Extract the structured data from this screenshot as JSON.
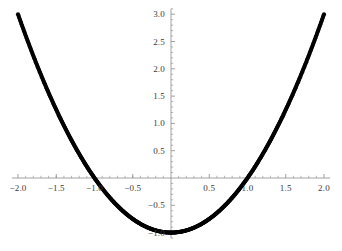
{
  "chart_data": {
    "type": "scatter",
    "title": "",
    "subtitle": "",
    "xlabel": "",
    "ylabel": "",
    "xlim": [
      -2.08,
      2.08
    ],
    "ylim": [
      -1.1,
      3.1
    ],
    "grid": false,
    "legend": null,
    "axes_style": "crossing-at-origin",
    "marker": "filled-circle",
    "marker_color": "#000000",
    "axis_color": "#808080",
    "function": "y = x^2 - 1",
    "x_ticks": [
      {
        "value": -2.0,
        "label": "-2.0"
      },
      {
        "value": -1.5,
        "label": "-1.5"
      },
      {
        "value": -1.0,
        "label": "-1.0"
      },
      {
        "value": -0.5,
        "label": "-0.5"
      },
      {
        "value": 0.5,
        "label": "0.5"
      },
      {
        "value": 1.0,
        "label": "1.0"
      },
      {
        "value": 1.5,
        "label": "1.5"
      },
      {
        "value": 2.0,
        "label": "2.0"
      }
    ],
    "y_ticks": [
      {
        "value": 3.0,
        "label": "3.0"
      },
      {
        "value": 2.5,
        "label": "2.5"
      },
      {
        "value": 2.0,
        "label": "2.0"
      },
      {
        "value": 1.5,
        "label": "1.5"
      },
      {
        "value": 1.0,
        "label": "1.0"
      },
      {
        "value": 0.5,
        "label": "0.5"
      },
      {
        "value": -0.5,
        "label": "-0.5"
      },
      {
        "value": -1.0,
        "label": "-1.0"
      }
    ],
    "x_minor_tick_step": 0.1,
    "y_minor_tick_step": 0.1,
    "series": [
      {
        "name": "y = x^2 - 1",
        "points": [
          [
            -2.0,
            3.0
          ],
          [
            -1.96,
            2.842
          ],
          [
            -1.92,
            2.686
          ],
          [
            -1.88,
            2.534
          ],
          [
            -1.84,
            2.386
          ],
          [
            -1.8,
            2.24
          ],
          [
            -1.76,
            2.098
          ],
          [
            -1.72,
            1.958
          ],
          [
            -1.68,
            1.822
          ],
          [
            -1.64,
            1.69
          ],
          [
            -1.6,
            1.56
          ],
          [
            -1.56,
            1.434
          ],
          [
            -1.52,
            1.31
          ],
          [
            -1.48,
            1.19
          ],
          [
            -1.44,
            1.074
          ],
          [
            -1.4,
            0.96
          ],
          [
            -1.36,
            0.85
          ],
          [
            -1.32,
            0.742
          ],
          [
            -1.28,
            0.638
          ],
          [
            -1.24,
            0.538
          ],
          [
            -1.2,
            0.44
          ],
          [
            -1.16,
            0.346
          ],
          [
            -1.12,
            0.254
          ],
          [
            -1.08,
            0.166
          ],
          [
            -1.04,
            0.082
          ],
          [
            -1.0,
            0.0
          ],
          [
            -0.96,
            -0.078
          ],
          [
            -0.92,
            -0.154
          ],
          [
            -0.88,
            -0.226
          ],
          [
            -0.84,
            -0.294
          ],
          [
            -0.8,
            -0.36
          ],
          [
            -0.76,
            -0.422
          ],
          [
            -0.72,
            -0.482
          ],
          [
            -0.68,
            -0.538
          ],
          [
            -0.64,
            -0.59
          ],
          [
            -0.6,
            -0.64
          ],
          [
            -0.56,
            -0.686
          ],
          [
            -0.52,
            -0.73
          ],
          [
            -0.48,
            -0.77
          ],
          [
            -0.44,
            -0.806
          ],
          [
            -0.4,
            -0.84
          ],
          [
            -0.36,
            -0.87
          ],
          [
            -0.32,
            -0.898
          ],
          [
            -0.28,
            -0.922
          ],
          [
            -0.24,
            -0.942
          ],
          [
            -0.2,
            -0.96
          ],
          [
            -0.16,
            -0.974
          ],
          [
            -0.12,
            -0.986
          ],
          [
            -0.08,
            -0.994
          ],
          [
            -0.04,
            -0.998
          ],
          [
            0.0,
            -1.0
          ],
          [
            0.04,
            -0.998
          ],
          [
            0.08,
            -0.994
          ],
          [
            0.12,
            -0.986
          ],
          [
            0.16,
            -0.974
          ],
          [
            0.2,
            -0.96
          ],
          [
            0.24,
            -0.942
          ],
          [
            0.28,
            -0.922
          ],
          [
            0.32,
            -0.898
          ],
          [
            0.36,
            -0.87
          ],
          [
            0.4,
            -0.84
          ],
          [
            0.44,
            -0.806
          ],
          [
            0.48,
            -0.77
          ],
          [
            0.52,
            -0.73
          ],
          [
            0.56,
            -0.686
          ],
          [
            0.6,
            -0.64
          ],
          [
            0.64,
            -0.59
          ],
          [
            0.68,
            -0.538
          ],
          [
            0.72,
            -0.482
          ],
          [
            0.76,
            -0.422
          ],
          [
            0.8,
            -0.36
          ],
          [
            0.84,
            -0.294
          ],
          [
            0.88,
            -0.226
          ],
          [
            0.92,
            -0.154
          ],
          [
            0.96,
            -0.078
          ],
          [
            1.0,
            0.0
          ],
          [
            1.04,
            0.082
          ],
          [
            1.08,
            0.166
          ],
          [
            1.12,
            0.254
          ],
          [
            1.16,
            0.346
          ],
          [
            1.2,
            0.44
          ],
          [
            1.24,
            0.538
          ],
          [
            1.28,
            0.638
          ],
          [
            1.32,
            0.742
          ],
          [
            1.36,
            0.85
          ],
          [
            1.4,
            0.96
          ],
          [
            1.44,
            1.074
          ],
          [
            1.48,
            1.19
          ],
          [
            1.52,
            1.31
          ],
          [
            1.56,
            1.434
          ],
          [
            1.6,
            1.56
          ],
          [
            1.64,
            1.69
          ],
          [
            1.68,
            1.822
          ],
          [
            1.72,
            1.958
          ],
          [
            1.76,
            2.098
          ],
          [
            1.8,
            2.24
          ],
          [
            1.84,
            2.386
          ],
          [
            1.88,
            2.534
          ],
          [
            1.92,
            2.686
          ],
          [
            1.96,
            2.842
          ],
          [
            2.0,
            3.0
          ]
        ]
      }
    ]
  }
}
